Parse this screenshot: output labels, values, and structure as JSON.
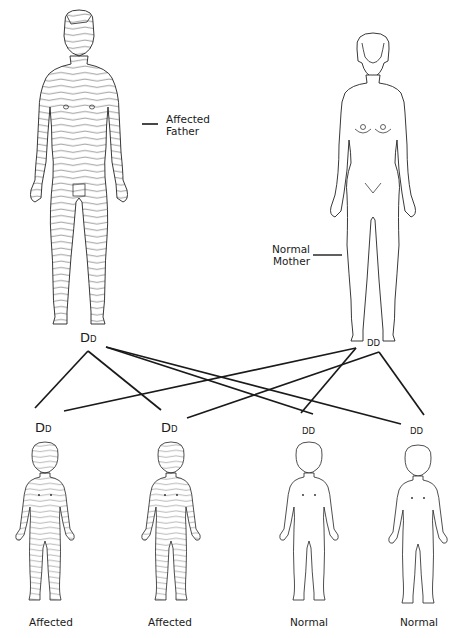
{
  "parents": {
    "father": {
      "label_line1": "Affected",
      "label_line2": "Father",
      "genotype_major": "D",
      "genotype_minor": "D",
      "status": "affected"
    },
    "mother": {
      "label_line1": "Normal",
      "label_line2": "Mother",
      "genotype_major": "D",
      "genotype_minor": "D",
      "genotype_style": "small-caps-both",
      "status": "normal"
    }
  },
  "children": [
    {
      "label": "Affected",
      "genotype_major": "D",
      "genotype_minor": "D",
      "status": "affected"
    },
    {
      "label": "Affected",
      "genotype_major": "D",
      "genotype_minor": "D",
      "status": "affected"
    },
    {
      "label": "Normal",
      "genotype_a": "D",
      "genotype_b": "D",
      "status": "normal"
    },
    {
      "label": "Normal",
      "genotype_a": "D",
      "genotype_b": "D",
      "status": "normal"
    }
  ],
  "colors": {
    "ink": "#1a1a1a",
    "background": "#ffffff"
  }
}
